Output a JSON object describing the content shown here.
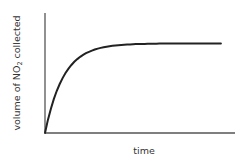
{
  "chart_data": {
    "type": "line",
    "title": "",
    "xlabel": "time",
    "ylabel": "volume of NO2 collected",
    "ylabel_parts": {
      "pre": "volume of NO",
      "sub": "2",
      "post": " collected"
    },
    "xticks": [],
    "yticks": [],
    "grid": false,
    "legend": null,
    "series": [
      {
        "name": "volume of NO2",
        "shape": "exponential rise to plateau",
        "x": [
          0,
          0.05,
          0.1,
          0.15,
          0.2,
          0.3,
          0.4,
          0.5,
          0.6,
          0.7,
          0.8,
          0.9,
          1.0
        ],
        "y": [
          0,
          0.37,
          0.6,
          0.75,
          0.84,
          0.94,
          0.98,
          0.99,
          1.0,
          1.0,
          1.0,
          1.0,
          1.0
        ]
      }
    ],
    "xlim": [
      0,
      1.08
    ],
    "ylim": [
      0,
      1.34
    ],
    "colors": {
      "axis": "#555555",
      "curve": "#222222"
    }
  }
}
